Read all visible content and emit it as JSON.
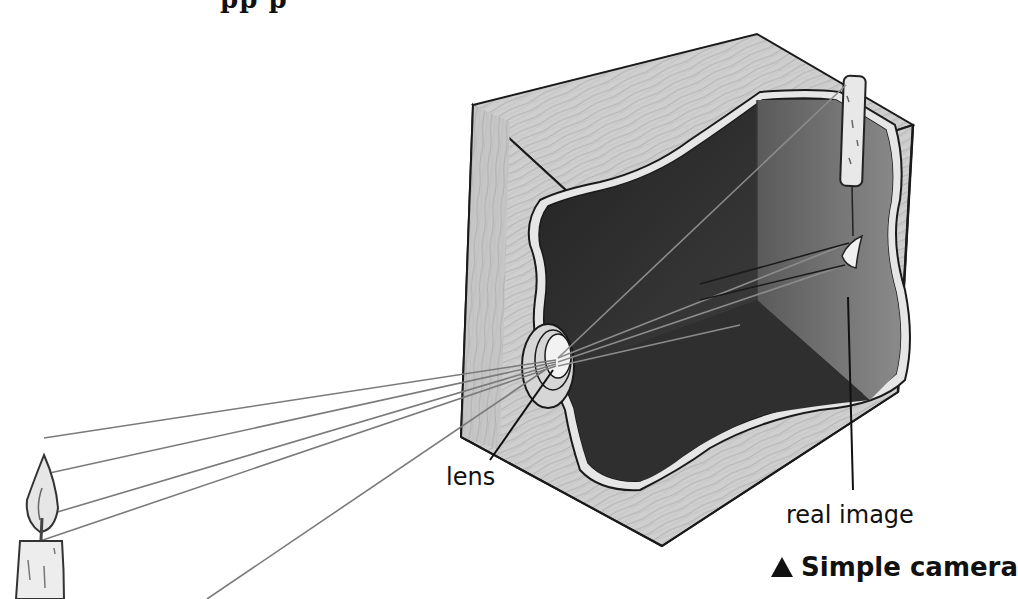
{
  "title_fragment": "pp               p",
  "labels": {
    "lens": "lens",
    "real_image": "real image"
  },
  "caption": {
    "icon": "triangle-up-icon",
    "text": "Simple camera"
  },
  "diagram": {
    "colors": {
      "wood": "#c9c9c9",
      "wood_dark": "#b3b3b3",
      "interior_dark": "#2b2b2b",
      "interior_back": "#6e6e6e",
      "interior_floor": "#3a3a3a",
      "outline": "#1a1a1a",
      "ray": "#7a7a7a",
      "candle": "#e4e4e4"
    }
  }
}
